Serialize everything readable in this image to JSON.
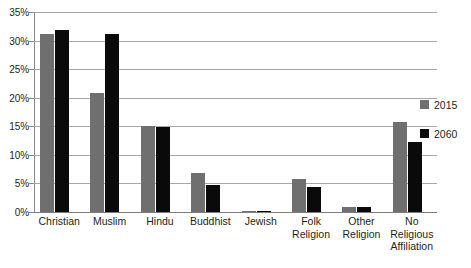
{
  "chart_data": {
    "type": "bar",
    "title": "",
    "subtitle": "",
    "xlabel": "",
    "ylabel": "",
    "ylim": [
      0,
      35
    ],
    "ytick_values": [
      0,
      5,
      10,
      15,
      20,
      25,
      30,
      35
    ],
    "ytick_labels": [
      "0%",
      "5%",
      "10%",
      "15%",
      "20%",
      "25%",
      "30%",
      "35%"
    ],
    "grid": true,
    "legend_position": "right",
    "categories": [
      "Christian",
      "Muslim",
      "Hindu",
      "Buddhist",
      "Jewish",
      "Folk\nReligion",
      "Other\nReligion",
      "No\nReligious\nAffiliation"
    ],
    "series": [
      {
        "name": "2015",
        "color": "#6f6f6f",
        "values": [
          31.2,
          20.9,
          15.1,
          6.9,
          0.2,
          5.7,
          0.8,
          15.8
        ]
      },
      {
        "name": "2060",
        "color": "#0a0a0a",
        "values": [
          31.8,
          31.1,
          14.9,
          4.8,
          0.2,
          4.3,
          0.8,
          12.2
        ]
      }
    ]
  },
  "colors": {
    "series_2015": "#6f6f6f",
    "series_2060": "#0a0a0a",
    "gridline": "#a7a7a7",
    "axis": "#8a8a8a",
    "text": "#231f20",
    "background": "#ffffff"
  }
}
